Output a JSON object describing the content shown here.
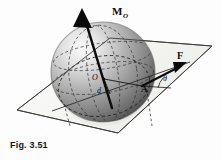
{
  "figure": {
    "caption": "Fig. 3.51",
    "background_color": "#fdfdfd",
    "ink_color": "#111111"
  },
  "labels": {
    "moment_vector": "M",
    "moment_vector_subscript": "O",
    "force_vector": "F",
    "center_point": "O",
    "moment_arm": "d",
    "application_point": "A",
    "angle": "θ"
  },
  "geometry": {
    "sphere": {
      "center_x": 103,
      "center_y": 72,
      "radius_x": 52,
      "radius_y": 50,
      "highlight_color": "#f2f2f2",
      "midtone_color": "#9a9a9a",
      "shadow_color": "#2a2a2a"
    },
    "plane": {
      "points": "17,110 110,38 212,46 118,133",
      "fill_color": "#f7f7f5",
      "edge_color": "#3a3a3a"
    },
    "moment_arrow": {
      "from_x": 112,
      "from_y": 106,
      "to_x": 82,
      "to_y": 10,
      "color": "#0b0b0b"
    },
    "force_arrow": {
      "from_x": 142,
      "from_y": 86,
      "to_x": 186,
      "to_y": 64,
      "color": "#0b0b0b"
    }
  },
  "icons": {
    "moment_arrowhead": "arrow-up-icon",
    "force_arrowhead": "arrow-right-icon"
  }
}
